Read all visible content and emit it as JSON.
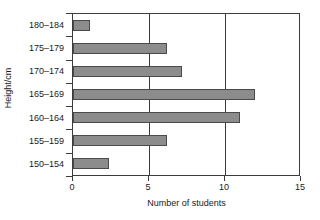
{
  "chart_data": {
    "type": "bar",
    "orientation": "horizontal",
    "title": "",
    "xlabel": "Number of students",
    "ylabel": "Height/cm",
    "categories": [
      "150–154",
      "155–159",
      "160–164",
      "165–169",
      "170–174",
      "175–179",
      "180–184"
    ],
    "values": [
      2.4,
      6.2,
      11,
      12,
      7.2,
      6.2,
      1.1
    ],
    "xlim": [
      0,
      15
    ],
    "xticks": [
      0,
      5,
      10,
      15
    ],
    "xtick_labels": [
      "0",
      "5",
      "10",
      "15"
    ],
    "grid": "vertical-at-xticks",
    "legend": null,
    "bar_color": "#8c8c8c",
    "bar_border_color": "#4a4a4a",
    "axis_color": "#3c3c3c",
    "background": "#ffffff"
  }
}
